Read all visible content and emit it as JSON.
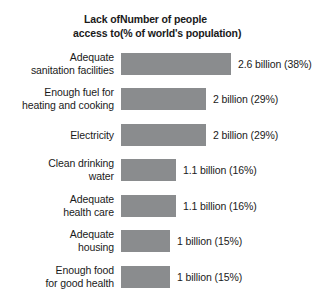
{
  "header": {
    "left_col_line1": "Lack of",
    "left_col_line2": "access to",
    "right_col_line1": "Number of people",
    "right_col_line2": "(% of world's population)"
  },
  "colors": {
    "bar": "#8a8c8e",
    "background": "#ffffff",
    "text": "#1a1a1a"
  },
  "chart_data": {
    "type": "bar",
    "orientation": "horizontal",
    "title": "Lack of access to",
    "subtitle": "Number of people (% of world's population)",
    "xlabel": "Number of people (% of world's population)",
    "ylabel": "Lack of access to",
    "grid": false,
    "legend": "none",
    "xlim": [
      0,
      2.9
    ],
    "units": "billions of people",
    "categories": [
      "Adequate sanitation facilities",
      "Enough fuel for heating and cooking",
      "Electricity",
      "Clean drinking water",
      "Adequate health care",
      "Adequate housing",
      "Enough food for good health"
    ],
    "values": [
      2.6,
      2.0,
      2.0,
      1.1,
      1.1,
      1.0,
      1.0
    ],
    "percent_values": [
      38,
      29,
      29,
      16,
      16,
      15,
      15
    ],
    "value_labels": [
      "2.6 billion (38%)",
      "2 billion (29%)",
      "2 billion (29%)",
      "1.1 billion (16%)",
      "1.1 billion (16%)",
      "1 billion (15%)",
      "1 billion (15%)"
    ]
  },
  "rows": [
    {
      "label_line1": "Adequate",
      "label_line2": "sanitation facilities",
      "value_label": "2.6 billion (38%)",
      "bar_px": 110
    },
    {
      "label_line1": "Enough fuel for",
      "label_line2": "heating and cooking",
      "value_label": "2 billion (29%)",
      "bar_px": 85
    },
    {
      "label_line1": "Electricity",
      "label_line2": "",
      "value_label": "2 billion (29%)",
      "bar_px": 85
    },
    {
      "label_line1": "Clean drinking",
      "label_line2": "water",
      "value_label": "1.1 billion (16%)",
      "bar_px": 55
    },
    {
      "label_line1": "Adequate",
      "label_line2": "health care",
      "value_label": "1.1 billion (16%)",
      "bar_px": 55
    },
    {
      "label_line1": "Adequate",
      "label_line2": "housing",
      "value_label": "1 billion (15%)",
      "bar_px": 49
    },
    {
      "label_line1": "Enough food",
      "label_line2": "for good health",
      "value_label": "1 billion (15%)",
      "bar_px": 49
    }
  ]
}
